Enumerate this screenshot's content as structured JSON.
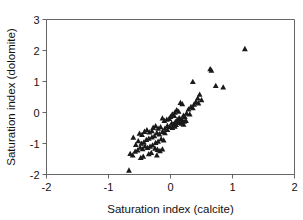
{
  "chart_data": {
    "type": "scatter",
    "title": "",
    "xlabel": "Saturation index (calcite)",
    "ylabel": "Saturation index (dolomite)",
    "xlim": [
      -2,
      2
    ],
    "ylim": [
      -2,
      3
    ],
    "xticks": [
      -2,
      -1,
      0,
      1,
      2
    ],
    "yticks": [
      -2,
      -1,
      0,
      1,
      2,
      3
    ],
    "xticklabels": [
      "-2",
      "-1",
      "0",
      "1",
      "2"
    ],
    "yticklabels": [
      "-2",
      "-1",
      "0",
      "1",
      "2",
      "3"
    ],
    "grid": false,
    "legend": null,
    "marker": "triangle",
    "marker_color": "#1a1a1a",
    "series": [
      {
        "name": "samples",
        "points": [
          [
            1.2,
            2.05
          ],
          [
            0.64,
            1.4
          ],
          [
            0.66,
            1.35
          ],
          [
            0.36,
            0.99
          ],
          [
            0.85,
            0.81
          ],
          [
            0.73,
            0.86
          ],
          [
            0.47,
            0.58
          ],
          [
            0.44,
            0.46
          ],
          [
            0.5,
            0.4
          ],
          [
            0.41,
            0.34
          ],
          [
            0.45,
            0.3
          ],
          [
            0.38,
            0.26
          ],
          [
            0.16,
            0.31
          ],
          [
            0.19,
            0.27
          ],
          [
            0.33,
            0.18
          ],
          [
            0.36,
            0.14
          ],
          [
            0.29,
            0.1
          ],
          [
            0.1,
            0.08
          ],
          [
            0.13,
            0.03
          ],
          [
            0.07,
            0.0
          ],
          [
            0.26,
            -0.03
          ],
          [
            0.31,
            -0.06
          ],
          [
            0.21,
            -0.1
          ],
          [
            0.23,
            -0.14
          ],
          [
            0.03,
            -0.06
          ],
          [
            0.06,
            -0.11
          ],
          [
            0.0,
            -0.14
          ],
          [
            0.14,
            -0.18
          ],
          [
            0.17,
            -0.21
          ],
          [
            0.11,
            -0.24
          ],
          [
            0.19,
            -0.26
          ],
          [
            0.22,
            -0.29
          ],
          [
            0.25,
            -0.27
          ],
          [
            0.08,
            -0.3
          ],
          [
            0.12,
            -0.33
          ],
          [
            0.15,
            -0.31
          ],
          [
            0.02,
            -0.35
          ],
          [
            0.05,
            -0.38
          ],
          [
            0.09,
            -0.4
          ],
          [
            0.18,
            -0.36
          ],
          [
            0.21,
            -0.39
          ],
          [
            -0.02,
            -0.2
          ],
          [
            -0.06,
            -0.23
          ],
          [
            -0.1,
            -0.27
          ],
          [
            -0.13,
            -0.19
          ],
          [
            -0.05,
            -0.43
          ],
          [
            -0.01,
            -0.46
          ],
          [
            0.03,
            -0.49
          ],
          [
            0.07,
            -0.45
          ],
          [
            -0.09,
            -0.52
          ],
          [
            -0.05,
            -0.56
          ],
          [
            -0.16,
            -0.47
          ],
          [
            -0.2,
            -0.52
          ],
          [
            -0.24,
            -0.44
          ],
          [
            -0.28,
            -0.49
          ],
          [
            -0.13,
            -0.62
          ],
          [
            -0.09,
            -0.66
          ],
          [
            -0.18,
            -0.7
          ],
          [
            -0.22,
            -0.66
          ],
          [
            -0.3,
            -0.6
          ],
          [
            -0.34,
            -0.64
          ],
          [
            -0.38,
            -0.57
          ],
          [
            -0.42,
            -0.62
          ],
          [
            -0.46,
            -0.72
          ],
          [
            -0.5,
            -0.68
          ],
          [
            -0.26,
            -0.76
          ],
          [
            -0.3,
            -0.8
          ],
          [
            -0.35,
            -0.84
          ],
          [
            -0.39,
            -0.88
          ],
          [
            -0.15,
            -0.86
          ],
          [
            -0.11,
            -0.9
          ],
          [
            -0.2,
            -0.94
          ],
          [
            -0.24,
            -0.98
          ],
          [
            -0.43,
            -0.96
          ],
          [
            -0.47,
            -1.0
          ],
          [
            -0.52,
            -0.92
          ],
          [
            -0.56,
            -1.04
          ],
          [
            -0.6,
            -0.81
          ],
          [
            -0.29,
            -1.06
          ],
          [
            -0.33,
            -1.1
          ],
          [
            -0.37,
            -1.14
          ],
          [
            -0.41,
            -1.09
          ],
          [
            -0.45,
            -1.18
          ],
          [
            -0.49,
            -1.13
          ],
          [
            -0.25,
            -1.16
          ],
          [
            -0.21,
            -1.2
          ],
          [
            -0.17,
            -1.24
          ],
          [
            -0.13,
            -1.19
          ],
          [
            -0.53,
            -1.22
          ],
          [
            -0.57,
            -1.26
          ],
          [
            -0.31,
            -1.3
          ],
          [
            -0.35,
            -1.34
          ],
          [
            -0.61,
            -1.38
          ],
          [
            -0.65,
            -1.33
          ],
          [
            -0.44,
            -1.42
          ],
          [
            -0.48,
            -1.46
          ],
          [
            -0.22,
            -1.38
          ],
          [
            -0.67,
            -1.87
          ]
        ]
      }
    ]
  },
  "figure": {
    "marker_size": "5"
  }
}
